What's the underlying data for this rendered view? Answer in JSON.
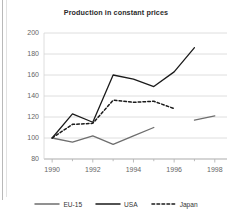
{
  "chart_data": {
    "type": "line",
    "title": "Production in constant prices",
    "xlabel": "",
    "ylabel": "",
    "xlim": [
      1989.6,
      1998.6
    ],
    "ylim": [
      80,
      200
    ],
    "grid": true,
    "y_ticks": [
      80,
      100,
      120,
      140,
      160,
      180,
      200
    ],
    "x_ticks": [
      1990,
      1991,
      1992,
      1993,
      1994,
      1995,
      1996,
      1997,
      1998
    ],
    "x_tick_labels": [
      "1990",
      "",
      "1992",
      "",
      "1994",
      "",
      "1996",
      "",
      "1998"
    ],
    "legend_position": "bottom",
    "series": [
      {
        "name": "EU-15",
        "color": "#6e6e6e",
        "style": "solid",
        "x": [
          1990,
          1991,
          1992,
          1993,
          1994,
          1995
        ],
        "values": [
          100,
          96,
          102,
          94,
          102,
          110
        ]
      },
      {
        "name": "EU-15",
        "color": "#6e6e6e",
        "style": "solid",
        "segment": 2,
        "x": [
          1997,
          1998
        ],
        "values": [
          117,
          121
        ]
      },
      {
        "name": "USA",
        "color": "#1a1a1a",
        "style": "solid",
        "x": [
          1990,
          1991,
          1992,
          1993,
          1994,
          1995,
          1996,
          1997
        ],
        "values": [
          100,
          123,
          115,
          160,
          156,
          149,
          163,
          186
        ]
      },
      {
        "name": "Japan",
        "color": "#1a1a1a",
        "style": "dashed",
        "x": [
          1990,
          1991,
          1992,
          1993,
          1994,
          1995,
          1996
        ],
        "values": [
          100,
          113,
          114,
          136,
          134,
          135,
          128
        ]
      }
    ]
  },
  "legend": {
    "items": [
      {
        "label": "EU-15",
        "color": "#6e6e6e",
        "style": "solid"
      },
      {
        "label": "USA",
        "color": "#1a1a1a",
        "style": "solid"
      },
      {
        "label": "Japan",
        "color": "#1a1a1a",
        "style": "dashed"
      }
    ]
  },
  "axes": {
    "y_labels": [
      "200",
      "180",
      "160",
      "140",
      "120",
      "100",
      "80"
    ],
    "x_labels": [
      "1990",
      "1992",
      "1994",
      "1996",
      "1998"
    ]
  }
}
